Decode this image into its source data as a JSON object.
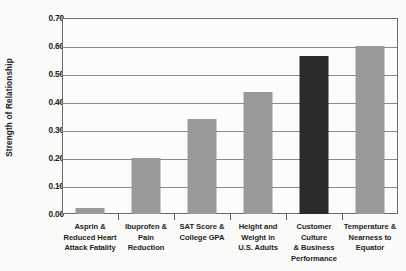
{
  "chart_data": {
    "type": "bar",
    "title": "",
    "xlabel": "",
    "ylabel": "Strength of Relationship",
    "ylim": [
      0.0,
      0.7
    ],
    "ytick_step": 0.1,
    "grid": true,
    "legend": "none",
    "categories": [
      "Asprin & Reduced Heart Attack Fatality",
      "Ibuprofen & Pain Reduction",
      "SAT Score & College GPA",
      "Height and Weight in U.S. Adults",
      "Customer Culture & Business Performance",
      "Temperature & Nearness to Equator"
    ],
    "category_lines": [
      [
        "Asprin &",
        "Reduced Heart",
        "Attack Fatality"
      ],
      [
        "Ibuprofen & Pain",
        "Reduction"
      ],
      [
        "SAT Score &",
        "College GPA"
      ],
      [
        "Height and",
        "Weight in",
        "U.S. Adults"
      ],
      [
        "Customer Culture",
        "& Business",
        "Performance"
      ],
      [
        "Temperature &",
        "Nearness to",
        "Equator"
      ]
    ],
    "values": [
      0.02,
      0.2,
      0.34,
      0.435,
      0.565,
      0.6
    ],
    "bar_colors": [
      "#9a9a9a",
      "#9a9a9a",
      "#9a9a9a",
      "#9a9a9a",
      "#2b2b2b",
      "#9a9a9a"
    ],
    "highlight_index": 4,
    "ytick_labels": [
      "0.70",
      "0.60",
      "0.50",
      "0.40",
      "0.30",
      "0.20",
      "0.10",
      "0.00"
    ],
    "ytick_values": [
      0.7,
      0.6,
      0.5,
      0.4,
      0.3,
      0.2,
      0.1,
      0.0
    ]
  },
  "colors": {
    "bar_default": "#9a9a9a",
    "bar_highlight": "#2b2b2b",
    "axis": "#6d6d6d",
    "gridline": "#8b8b8b",
    "text": "#1f1f1f",
    "background": "#fbfbfa"
  }
}
